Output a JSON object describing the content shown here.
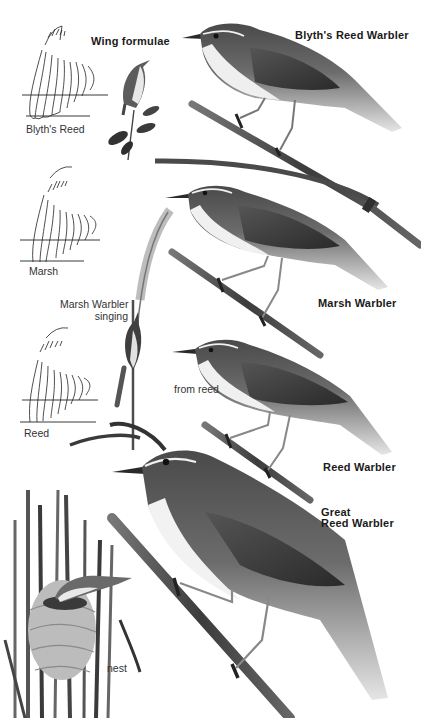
{
  "page": {
    "title": "Wing formulae",
    "palette": {
      "background": "#ffffff",
      "ink": "#1a1a1a",
      "bird_dark": "#3a3a3a",
      "bird_mid": "#6e6e6e",
      "bird_light": "#d9d9d9",
      "reed": "#555555"
    }
  },
  "wing_formulae": {
    "heading": "Wing formulae",
    "items": [
      {
        "label": "Blyth's Reed"
      },
      {
        "label": "Marsh"
      },
      {
        "label": "Reed"
      }
    ]
  },
  "species": [
    {
      "name": "Blyth's Reed Warbler"
    },
    {
      "name": "Marsh Warbler"
    },
    {
      "name": "Reed Warbler"
    },
    {
      "name_line1": "Great",
      "name_line2": "Reed Warbler"
    }
  ],
  "annotations": {
    "marsh_singing_line1": "Marsh Warbler",
    "marsh_singing_line2": "singing",
    "from_reed": "from reed",
    "nest": "nest"
  }
}
